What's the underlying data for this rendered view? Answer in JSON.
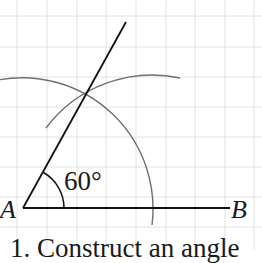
{
  "figure": {
    "labels": {
      "point_a": "A",
      "point_b": "B",
      "angle": "60°"
    },
    "caption": "1. Construct an angle",
    "colors": {
      "background": "#ffffff",
      "grid": "#e2e2e2",
      "line": "#111111",
      "arc": "#707070",
      "text": "#1a1a1a"
    },
    "geometry": {
      "vertex_a": [
        23,
        208
      ],
      "end_b": [
        230,
        208
      ],
      "ray_end": [
        126,
        22
      ],
      "arc_intersection": [
        87,
        92
      ],
      "construction_radius": 130,
      "angle_arc_radius": 41,
      "angle_degrees": 60
    },
    "grid": {
      "x_lines": [
        17,
        47,
        77,
        106,
        136,
        166,
        195,
        225,
        254
      ],
      "y_lines": [
        16,
        47,
        77,
        107,
        137,
        167,
        197,
        227
      ]
    }
  }
}
